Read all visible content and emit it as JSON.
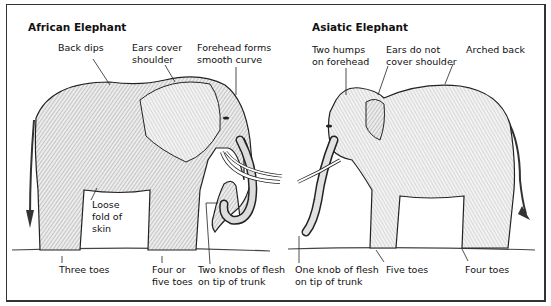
{
  "diagram": {
    "type": "labeled-illustration-comparison",
    "panels": [
      {
        "title": "African Elephant",
        "labels": [
          {
            "id": "back-dips",
            "text": "Back dips"
          },
          {
            "id": "ears-cover-shoulder",
            "text": "Ears cover\nshoulder"
          },
          {
            "id": "forehead-smooth",
            "text": "Forehead forms\nsmooth curve"
          },
          {
            "id": "loose-fold",
            "text": "Loose\nfold of\nskin"
          },
          {
            "id": "three-toes",
            "text": "Three toes"
          },
          {
            "id": "four-or-five-toes",
            "text": "Four or\nfive toes"
          },
          {
            "id": "two-knobs",
            "text": "Two knobs of flesh\non tip of trunk"
          }
        ]
      },
      {
        "title": "Asiatic Elephant",
        "labels": [
          {
            "id": "two-humps",
            "text": "Two humps\non forehead"
          },
          {
            "id": "ears-not-cover",
            "text": "Ears do not\ncover shoulder"
          },
          {
            "id": "arched-back",
            "text": "Arched back"
          },
          {
            "id": "one-knob",
            "text": "One knob of flesh\non tip of trunk"
          },
          {
            "id": "five-toes",
            "text": "Five toes"
          },
          {
            "id": "four-toes",
            "text": "Four toes"
          }
        ]
      }
    ]
  }
}
